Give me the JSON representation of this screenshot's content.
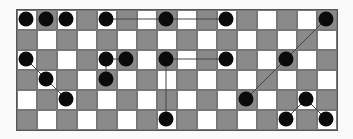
{
  "board": {
    "cols": 16,
    "rows": 6,
    "cell_size": 20,
    "colors": {
      "light": "#ffffff",
      "dark": "#8a8a8a",
      "stone": "#0a0a0a",
      "line": "#444444"
    },
    "stones": [
      {
        "r": 0,
        "c": 0
      },
      {
        "r": 0,
        "c": 1
      },
      {
        "r": 0,
        "c": 2
      },
      {
        "r": 0,
        "c": 4
      },
      {
        "r": 0,
        "c": 7
      },
      {
        "r": 0,
        "c": 10
      },
      {
        "r": 0,
        "c": 15
      },
      {
        "r": 2,
        "c": 0
      },
      {
        "r": 2,
        "c": 4
      },
      {
        "r": 2,
        "c": 5
      },
      {
        "r": 2,
        "c": 7
      },
      {
        "r": 2,
        "c": 10
      },
      {
        "r": 2,
        "c": 13
      },
      {
        "r": 3,
        "c": 1
      },
      {
        "r": 3,
        "c": 4
      },
      {
        "r": 4,
        "c": 2
      },
      {
        "r": 4,
        "c": 11
      },
      {
        "r": 4,
        "c": 14
      },
      {
        "r": 5,
        "c": 7
      },
      {
        "r": 5,
        "c": 13
      },
      {
        "r": 5,
        "c": 15
      }
    ],
    "lines": [
      [
        [
          0,
          4
        ],
        [
          0,
          7
        ]
      ],
      [
        [
          0,
          7
        ],
        [
          0,
          10
        ]
      ],
      [
        [
          2,
          7
        ],
        [
          2,
          10
        ]
      ],
      [
        [
          2,
          7
        ],
        [
          5,
          7
        ]
      ],
      [
        [
          2,
          4
        ],
        [
          2,
          5
        ]
      ],
      [
        [
          2,
          4
        ],
        [
          3,
          4
        ]
      ],
      [
        [
          2,
          0
        ],
        [
          3,
          1
        ]
      ],
      [
        [
          3,
          1
        ],
        [
          4,
          2
        ]
      ],
      [
        [
          4,
          11
        ],
        [
          2,
          13
        ]
      ],
      [
        [
          2,
          13
        ],
        [
          0,
          15
        ]
      ],
      [
        [
          5,
          13
        ],
        [
          4,
          14
        ]
      ],
      [
        [
          4,
          14
        ],
        [
          5,
          15
        ]
      ]
    ]
  }
}
